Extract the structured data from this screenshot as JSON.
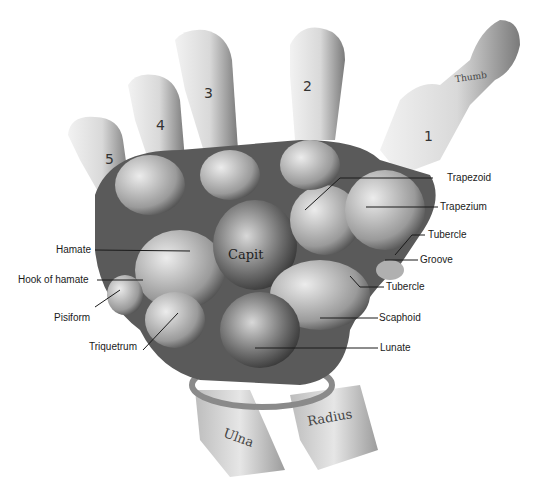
{
  "figure": {
    "metacarpal_numbers": [
      "1",
      "2",
      "3",
      "4",
      "5"
    ],
    "bone_inscriptions": {
      "capitate": "Capit",
      "ulna": "Ulna",
      "radius": "Radius",
      "thumb": "Thumb"
    },
    "labels_left": [
      {
        "text": "Hamate"
      },
      {
        "text": "Hook of hamate"
      },
      {
        "text": "Pisiform"
      },
      {
        "text": "Triquetrum"
      }
    ],
    "labels_right": [
      {
        "text": "Trapezoid"
      },
      {
        "text": "Trapezium"
      },
      {
        "text": "Tubercle"
      },
      {
        "text": "Groove"
      },
      {
        "text": "Tubercle"
      },
      {
        "text": "Scaphoid"
      },
      {
        "text": "Lunate"
      }
    ]
  }
}
